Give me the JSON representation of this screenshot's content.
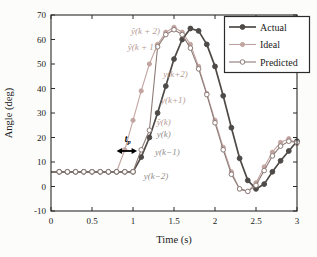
{
  "figure": {
    "background": "#fcfcfa",
    "axis_color": "#2b2b2b",
    "plot_bg": "#ffffff"
  },
  "chart_data": {
    "type": "line",
    "title": "",
    "xlabel": "Time (s)",
    "ylabel": "Angle (deg)",
    "xlim": [
      0,
      3
    ],
    "ylim": [
      -10,
      70
    ],
    "xticks": [
      0,
      0.5,
      1,
      1.5,
      2,
      2.5,
      3
    ],
    "xtick_labels": [
      "0",
      "0.5",
      "1",
      "1.5",
      "2",
      "2.5",
      "3"
    ],
    "yticks": [
      -10,
      0,
      10,
      20,
      30,
      40,
      50,
      60,
      70
    ],
    "ytick_labels": [
      "-10",
      "0",
      "10",
      "20",
      "30",
      "40",
      "50",
      "60",
      "70"
    ],
    "grid": false,
    "legend_position": "top-right",
    "x": [
      0,
      0.1,
      0.2,
      0.3,
      0.4,
      0.5,
      0.6,
      0.7,
      0.8,
      0.9,
      1,
      1.1,
      1.2,
      1.3,
      1.4,
      1.5,
      1.6,
      1.7,
      1.8,
      1.9,
      2,
      2.1,
      2.2,
      2.3,
      2.4,
      2.5,
      2.6,
      2.7,
      2.8,
      2.9,
      3
    ],
    "series": [
      {
        "name": "Ideal",
        "color": "#c2a5a1",
        "marker": "filled-circle",
        "line_width": 1.1,
        "marker_radius": 2.1,
        "values": [
          6,
          6,
          6,
          6,
          6,
          6,
          6,
          6,
          6,
          15,
          27,
          39,
          50,
          58,
          63,
          65,
          63,
          58,
          49,
          38,
          27,
          16,
          6,
          -1,
          -2,
          1.5,
          8,
          14,
          18,
          19.5,
          17.5
        ]
      },
      {
        "name": "Actual",
        "color": "#4e4a47",
        "marker": "filled-circle",
        "line_width": 1.7,
        "marker_radius": 2.4,
        "values": [
          6,
          6,
          6,
          6,
          6,
          6,
          6,
          6,
          6,
          6,
          6,
          12,
          20,
          30,
          41,
          52,
          60,
          64.5,
          63.5,
          58,
          49,
          37,
          24,
          11.5,
          2.5,
          -1,
          1,
          6,
          10.5,
          14.5,
          18.5
        ]
      },
      {
        "name": "Predicted",
        "color": "#8c7c77",
        "marker": "open-circle",
        "line_width": 1.1,
        "marker_radius": 2.3,
        "values": [
          6,
          6,
          6,
          6,
          6,
          6,
          6,
          6,
          6,
          6,
          6,
          15,
          23,
          57,
          62,
          64,
          62,
          56.5,
          48,
          37.5,
          26,
          15,
          5,
          -1,
          -2,
          0.5,
          6.5,
          12.5,
          16.5,
          18.5,
          18
        ]
      }
    ],
    "legend_order": [
      "Actual",
      "Ideal",
      "Predicted"
    ],
    "annotations": [
      {
        "text": "ŷ(k + 2)",
        "x": 1.33,
        "y": 63.5,
        "anchor": "end",
        "color": "#b49a94"
      },
      {
        "text": "ŷ(k + 1)",
        "x": 1.29,
        "y": 57.0,
        "anchor": "end",
        "color": "#b49a94"
      },
      {
        "text": "y(k+2)",
        "x": 1.37,
        "y": 46.0,
        "anchor": "start",
        "color": "#b49a94"
      },
      {
        "text": "y(k+1)",
        "x": 1.34,
        "y": 35.5,
        "anchor": "start",
        "color": "#b49a94"
      },
      {
        "text": "ŷ(k)",
        "x": 1.29,
        "y": 26.5,
        "anchor": "start",
        "color": "#b49a94"
      },
      {
        "text": "y(k)",
        "x": 1.29,
        "y": 21.5,
        "anchor": "start",
        "color": "#918d8a"
      },
      {
        "text": "y(k−1)",
        "x": 1.27,
        "y": 14.0,
        "anchor": "start",
        "color": "#918d8a"
      },
      {
        "text": "y(k−2)",
        "x": 1.13,
        "y": 4.5,
        "anchor": "start",
        "color": "#918d8a"
      }
    ],
    "tp_annotation": {
      "text_main": "t",
      "text_sub": "p",
      "label_x": 0.9,
      "label_y": 19.5,
      "arrow_x1": 0.8,
      "arrow_x2": 1.05,
      "arrow_y": 14.5,
      "color": "#000000"
    }
  }
}
